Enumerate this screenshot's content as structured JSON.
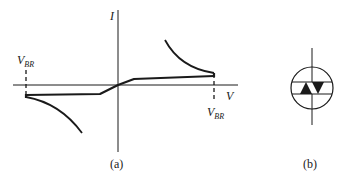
{
  "figure": {
    "panel_a": {
      "caption": "(a)",
      "axis_y_label": "I",
      "axis_x_label": "V",
      "breakover_left_label": "V",
      "breakover_left_sub": "BR",
      "breakover_right_label": "V",
      "breakover_right_sub": "BR"
    },
    "panel_b": {
      "caption": "(b)",
      "symbol": "diac-icon"
    },
    "colors": {
      "ink": "#1a1a1a",
      "background": "#ffffff"
    }
  }
}
